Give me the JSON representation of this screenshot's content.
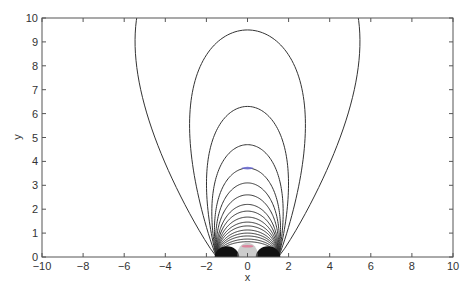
{
  "chart_data": {
    "type": "line",
    "title": "",
    "xlabel": "x",
    "ylabel": "y",
    "xlim": [
      -10,
      10
    ],
    "ylim": [
      0,
      10
    ],
    "grid": false,
    "legend": null,
    "x_ticks": [
      -10,
      -8,
      -6,
      -4,
      -2,
      0,
      2,
      4,
      6,
      8,
      10
    ],
    "y_ticks": [
      0,
      1,
      2,
      3,
      4,
      5,
      6,
      7,
      8,
      9,
      10
    ],
    "x_tick_labels": [
      "−10",
      "−8",
      "−6",
      "−4",
      "−2",
      "0",
      "2",
      "4",
      "6",
      "8",
      "10"
    ],
    "y_tick_labels": [
      "0",
      "1",
      "2",
      "3",
      "4",
      "5",
      "6",
      "7",
      "8",
      "9",
      "10"
    ],
    "contours": [
      {
        "apex": 14.0,
        "half_width": 9.9,
        "foot": 1.5,
        "note": "outermost curve, exits top of plot at x≈±9.55"
      },
      {
        "apex": 9.5,
        "half_width": 4.7,
        "foot": 1.5
      },
      {
        "apex": 6.3,
        "half_width": 3.0,
        "foot": 1.5
      },
      {
        "apex": 4.7,
        "half_width": 2.4,
        "foot": 1.5
      },
      {
        "apex": 3.72,
        "half_width": 2.05,
        "foot": 1.5
      },
      {
        "apex": 3.1,
        "half_width": 1.85,
        "foot": 1.5
      },
      {
        "apex": 2.6,
        "half_width": 1.72,
        "foot": 1.5
      },
      {
        "apex": 2.2,
        "half_width": 1.62,
        "foot": 1.5
      },
      {
        "apex": 1.92,
        "half_width": 1.56,
        "foot": 1.5
      },
      {
        "apex": 1.67,
        "half_width": 1.52,
        "foot": 1.5
      },
      {
        "apex": 1.46,
        "half_width": 1.5,
        "foot": 1.5
      },
      {
        "apex": 1.3,
        "half_width": 1.48,
        "foot": 1.5
      },
      {
        "apex": 1.13,
        "half_width": 1.47,
        "foot": 1.5
      },
      {
        "apex": 1.0,
        "half_width": 1.46,
        "foot": 1.5
      },
      {
        "apex": 0.88,
        "half_width": 1.46,
        "foot": 1.5
      },
      {
        "apex": 0.75,
        "half_width": 1.46,
        "foot": 1.5
      },
      {
        "apex": 0.64,
        "half_width": 1.46,
        "foot": 1.5
      }
    ],
    "dense_lobes": [
      {
        "center_x": -1.0,
        "radius_x": 0.6,
        "height": 0.45
      },
      {
        "center_x": 1.0,
        "radius_x": 0.6,
        "height": 0.45
      }
    ],
    "markers": [
      {
        "x": 0,
        "y": 3.72,
        "color": "#6a6ad8",
        "note": "faint blue tint on contour"
      },
      {
        "x": 0,
        "y": 0.45,
        "color": "#e07090",
        "note": "faint pink tint near origin"
      }
    ],
    "colors": {
      "line": "#333333",
      "axis": "#555555",
      "dense": "#111111"
    }
  }
}
